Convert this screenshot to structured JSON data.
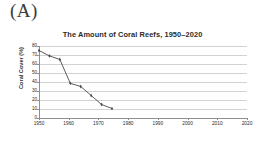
{
  "panel": {
    "label": "(A)"
  },
  "colors": {
    "series": "#4a4a4a",
    "grid": "#d2d2d2",
    "axis": "#8e8e8e",
    "text": "#2b2b2b",
    "background": "#ffffff"
  },
  "chart_data": {
    "type": "line",
    "title": "The Amount of Coral Reefs, 1950–2020",
    "xlabel": "",
    "ylabel": "Coral Cover (%)",
    "x": [
      1950,
      1960,
      1970,
      1980,
      1990,
      2000,
      2010,
      2020
    ],
    "xtick_labels": [
      "1950",
      "1960",
      "1970",
      "1980",
      "1990",
      "2000",
      "2010",
      "2020"
    ],
    "values": [
      75,
      69,
      65,
      38.5,
      35,
      25,
      15,
      10.5
    ],
    "ytick_labels": [
      "80",
      "70",
      "60",
      "50",
      "40",
      "30",
      "20",
      "10",
      "0"
    ],
    "yticks": [
      80,
      70,
      60,
      50,
      40,
      30,
      20,
      10,
      0
    ],
    "ylim": [
      0,
      80
    ],
    "xlim": [
      1950,
      2020
    ],
    "grid": "horizontal",
    "legend": "none",
    "marker": "diamond",
    "series_name": "Coral Cover (%)"
  }
}
